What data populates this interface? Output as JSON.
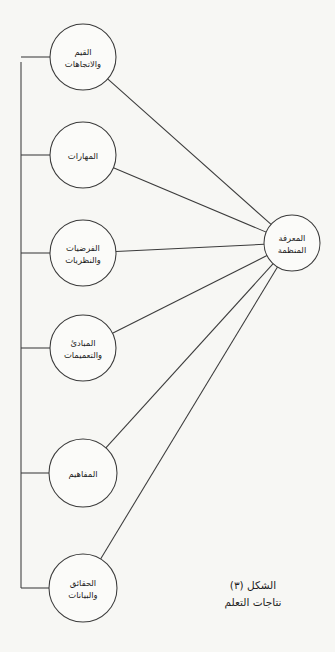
{
  "figure": {
    "title_line1": "الشكل (٣)",
    "title_line2": "نتاجات التعلم",
    "background_color": "#f7f7f4",
    "line_color": "#3b3b3b",
    "text_color": "#1d1d1d"
  },
  "hub": {
    "label_line1": "المعرفة",
    "label_line2": "المنظمة",
    "cx": 292,
    "cy": 243,
    "r": 28
  },
  "nodes": [
    {
      "id": "values-attitudes",
      "label_line1": "القيم",
      "label_line2": "والاتجاهات",
      "cx": 83,
      "cy": 57,
      "r": 33
    },
    {
      "id": "skills",
      "label_line1": "المهارات",
      "label_line2": "",
      "cx": 83,
      "cy": 155,
      "r": 33
    },
    {
      "id": "hypotheses-theories",
      "label_line1": "الفرضيات",
      "label_line2": "والنظريات",
      "cx": 83,
      "cy": 253,
      "r": 33
    },
    {
      "id": "principles-generalizations",
      "label_line1": "المبادئ",
      "label_line2": "والتعميمات",
      "cx": 83,
      "cy": 348,
      "r": 33
    },
    {
      "id": "concepts",
      "label_line1": "المفاهيم",
      "label_line2": "",
      "cx": 83,
      "cy": 473,
      "r": 34
    },
    {
      "id": "facts-data",
      "label_line1": "الحقائق",
      "label_line2": "والبيانات",
      "cx": 83,
      "cy": 588,
      "r": 34
    }
  ],
  "bracket": {
    "x": 21,
    "y_top": 62,
    "y_bottom": 588,
    "stub_x_end": 50
  },
  "links": [
    {
      "from": "values-attitudes",
      "to": "hub"
    },
    {
      "from": "skills",
      "to": "hub"
    },
    {
      "from": "hypotheses-theories",
      "to": "hub"
    },
    {
      "from": "principles-generalizations",
      "to": "hub"
    },
    {
      "from": "concepts",
      "to": "hub"
    },
    {
      "from": "facts-data",
      "to": "hub"
    }
  ]
}
